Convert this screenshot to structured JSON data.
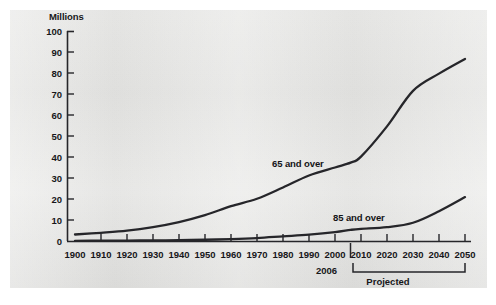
{
  "chart_data": {
    "type": "line",
    "title": "",
    "xlabel": "",
    "ylabel": "Millions",
    "ylim": [
      0,
      100
    ],
    "xlim": [
      1900,
      2050
    ],
    "grid": false,
    "legend_position": "inline-labels",
    "x": [
      1900,
      1910,
      1920,
      1930,
      1940,
      1950,
      1960,
      1970,
      1980,
      1990,
      2000,
      2006,
      2010,
      2020,
      2030,
      2040,
      2050
    ],
    "series": [
      {
        "name": "65 and over",
        "values": [
          3.1,
          3.9,
          4.9,
          6.6,
          9.0,
          12.3,
          16.6,
          20.1,
          25.5,
          31.2,
          35.0,
          37.3,
          40.2,
          54.6,
          71.5,
          79.7,
          86.7
        ]
      },
      {
        "name": "85 and over",
        "values": [
          0.1,
          0.2,
          0.2,
          0.3,
          0.4,
          0.6,
          0.9,
          1.4,
          2.2,
          3.0,
          4.2,
          5.3,
          5.8,
          6.6,
          8.7,
          14.2,
          20.9
        ]
      }
    ],
    "annotations": [
      {
        "name": "marker-2006",
        "label": "2006",
        "x": 2006
      },
      {
        "name": "projected-bracket",
        "label": "Projected",
        "x_start": 2010,
        "x_end": 2050
      }
    ],
    "y_ticks": [
      "0",
      "10",
      "20",
      "30",
      "40",
      "50",
      "60",
      "70",
      "80",
      "90",
      "100"
    ],
    "x_ticks": [
      "1900",
      "1910",
      "1920",
      "1930",
      "1940",
      "1950",
      "1960",
      "1970",
      "1980",
      "1990",
      "2000",
      "2010",
      "2020",
      "2030",
      "2040",
      "2050"
    ],
    "colors": {
      "line": "#26262a",
      "axis": "#26262a",
      "panel": "#e8e8e6",
      "text": "#17171a"
    }
  },
  "axis": {
    "units": "Millions"
  },
  "series_labels": {
    "s65": "65 and over",
    "s85": "85 and over"
  },
  "annotations": {
    "marker_2006": "2006",
    "projected": "Projected"
  }
}
